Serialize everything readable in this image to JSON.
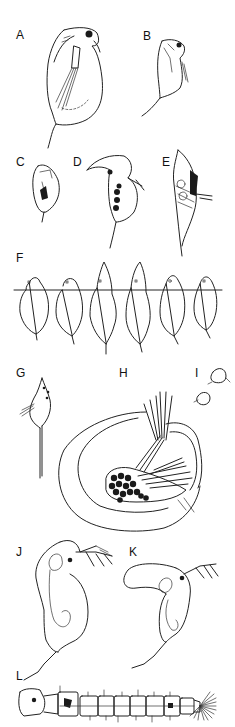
{
  "figure": {
    "panels": [
      {
        "id": "A",
        "label": "A",
        "subject": "daphnid, lateral view, rounded carapace with tail spine"
      },
      {
        "id": "B",
        "label": "B",
        "subject": "daphnid, smaller, lateral view"
      },
      {
        "id": "C",
        "label": "C",
        "subject": "small rounded cladoceran"
      },
      {
        "id": "D",
        "label": "D",
        "subject": "cladoceran with hooked helmet and eggs"
      },
      {
        "id": "E",
        "label": "E",
        "subject": "cladoceran with tall pointed helmet and long spine"
      },
      {
        "id": "F",
        "label": "F",
        "subject": "seasonal series of six body outlines (cyclomorphosis) aligned on a horizontal line"
      },
      {
        "id": "G",
        "label": "G",
        "subject": "small cladoceran with very long tail spine"
      },
      {
        "id": "H",
        "label": "H",
        "subject": "large cladoceran with brood of eggs and large antennae"
      },
      {
        "id": "I",
        "label": "I",
        "subject": "two tiny rounded cladocerans"
      },
      {
        "id": "J",
        "label": "J",
        "subject": "cladoceran with rounded helmet, antennae and long spine"
      },
      {
        "id": "K",
        "label": "K",
        "subject": "cladoceran with elongated backward helmet"
      },
      {
        "id": "L",
        "label": "L",
        "subject": "segmented insect larva with terminal fan of bristles"
      }
    ],
    "series_F_count": 6,
    "colors": {
      "background": "#ffffff",
      "ink": "#222222"
    }
  }
}
